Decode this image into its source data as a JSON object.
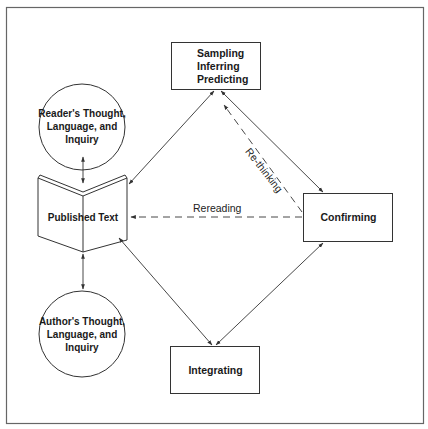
{
  "diagram": {
    "nodes": {
      "sampling": {
        "lines": [
          "Sampling",
          "Inferring",
          "Predicting"
        ],
        "shape": "rectangle"
      },
      "reader": {
        "lines": [
          "Reader's Thought,",
          "Language, and",
          "Inquiry"
        ],
        "shape": "circle"
      },
      "published": {
        "label": "Published Text",
        "shape": "open-book"
      },
      "author": {
        "lines": [
          "Author's Thought,",
          "Language, and",
          "Inquiry"
        ],
        "shape": "circle"
      },
      "confirming": {
        "label": "Confirming",
        "shape": "rectangle"
      },
      "integrating": {
        "label": "Integrating",
        "shape": "rectangle"
      }
    },
    "edges": [
      {
        "from": "reader",
        "to": "published",
        "style": "solid",
        "arrows": "both"
      },
      {
        "from": "published",
        "to": "author",
        "style": "solid",
        "arrows": "both"
      },
      {
        "from": "sampling",
        "to": "published",
        "style": "solid",
        "arrows": "both"
      },
      {
        "from": "sampling",
        "to": "confirming",
        "style": "solid",
        "arrows": "both"
      },
      {
        "from": "confirming",
        "to": "sampling",
        "style": "dashed",
        "arrows": "to",
        "label": "Re-thinking"
      },
      {
        "from": "confirming",
        "to": "published",
        "style": "dashed",
        "arrows": "to",
        "label": "Rereading"
      },
      {
        "from": "published",
        "to": "integrating",
        "style": "solid",
        "arrows": "both"
      },
      {
        "from": "confirming",
        "to": "integrating",
        "style": "solid",
        "arrows": "both"
      }
    ],
    "edge_labels": {
      "rethinking": "Re-thinking",
      "rereading": "Rereading"
    },
    "colors": {
      "stroke": "#333333",
      "text": "#1a1a1a",
      "frame": "#666666",
      "background": "#ffffff"
    }
  }
}
